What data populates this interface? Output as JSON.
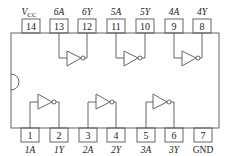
{
  "diagram": {
    "type": "IC pinout",
    "top_pins": [
      {
        "num": "14",
        "label": "V",
        "sub": "CC",
        "x": 31
      },
      {
        "num": "13",
        "label": "6A",
        "x": 59
      },
      {
        "num": "12",
        "label": "6Y",
        "x": 87
      },
      {
        "num": "11",
        "label": "5A",
        "x": 116
      },
      {
        "num": "10",
        "label": "5Y",
        "x": 145
      },
      {
        "num": "9",
        "label": "4A",
        "x": 174
      },
      {
        "num": "8",
        "label": "4Y",
        "x": 202
      }
    ],
    "bottom_pins": [
      {
        "num": "1",
        "label": "1A",
        "x": 30
      },
      {
        "num": "2",
        "label": "1Y",
        "x": 59
      },
      {
        "num": "3",
        "label": "2A",
        "x": 88
      },
      {
        "num": "4",
        "label": "2Y",
        "x": 116
      },
      {
        "num": "5",
        "label": "3A",
        "x": 146
      },
      {
        "num": "6",
        "label": "3Y",
        "x": 174
      },
      {
        "num": "7",
        "label": "GND",
        "x": 203
      }
    ],
    "gates": [
      {
        "name": "inverter-6",
        "input_pin": "13",
        "output_pin": "12"
      },
      {
        "name": "inverter-5",
        "input_pin": "11",
        "output_pin": "10"
      },
      {
        "name": "inverter-4",
        "input_pin": "9",
        "output_pin": "8"
      },
      {
        "name": "inverter-1",
        "input_pin": "1",
        "output_pin": "2"
      },
      {
        "name": "inverter-2",
        "input_pin": "3",
        "output_pin": "4"
      },
      {
        "name": "inverter-3",
        "input_pin": "5",
        "output_pin": "6"
      }
    ],
    "line_color": "#555555"
  }
}
